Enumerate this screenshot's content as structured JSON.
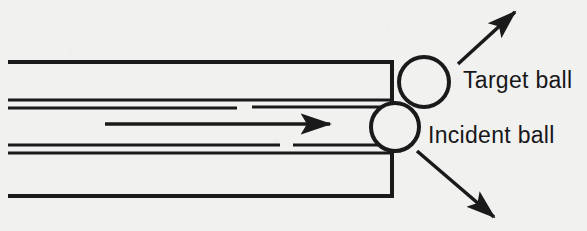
{
  "figure": {
    "background_color": "#f1f1f0",
    "ink_color": "#1a1a1a",
    "width": 587,
    "height": 231
  },
  "labels": {
    "target_ball": "Target ball",
    "incident_ball": "Incident ball"
  },
  "balls": [
    {
      "name": "target-ball",
      "label": "Target ball",
      "cx": 424,
      "cy": 82,
      "r": 25,
      "stroke_width": 4
    },
    {
      "name": "incident-ball",
      "label": "Incident ball",
      "cx": 395,
      "cy": 127,
      "r": 24,
      "stroke_width": 4
    }
  ],
  "rails": {
    "top_rail": {
      "x1": 8,
      "y1": 62,
      "x2": 392,
      "y2": 62,
      "stroke_width": 4
    },
    "top_rail_edge": {
      "x1": 392,
      "y1": 60,
      "x2": 392,
      "y2": 104,
      "stroke_width": 4
    },
    "bottom_rail": {
      "x1": 8,
      "y1": 196,
      "x2": 392,
      "y2": 196,
      "stroke_width": 4
    },
    "bottom_rail_edge": {
      "x1": 392,
      "y1": 150,
      "x2": 392,
      "y2": 198,
      "stroke_width": 4
    }
  },
  "channel_lines": [
    {
      "name": "upper-channel-line-a",
      "x1": 8,
      "y1": 100,
      "x2": 392,
      "y2": 100,
      "stroke_width": 3
    },
    {
      "name": "upper-channel-line-b",
      "x1": 8,
      "y1": 108,
      "x2": 237,
      "y2": 108,
      "stroke_width": 3
    },
    {
      "name": "upper-channel-line-b-cont",
      "x1": 252,
      "y1": 107,
      "x2": 392,
      "y2": 107,
      "stroke_width": 3
    },
    {
      "name": "lower-channel-line-a",
      "x1": 8,
      "y1": 145,
      "x2": 280,
      "y2": 145,
      "stroke_width": 3
    },
    {
      "name": "lower-channel-line-a-cont",
      "x1": 293,
      "y1": 145,
      "x2": 380,
      "y2": 145,
      "stroke_width": 3
    },
    {
      "name": "lower-channel-line-b",
      "x1": 8,
      "y1": 153,
      "x2": 392,
      "y2": 153,
      "stroke_width": 3
    }
  ],
  "arrows": [
    {
      "name": "incident-velocity-arrow",
      "direction": "right",
      "x1": 105,
      "y1": 124,
      "x2": 337,
      "y2": 124,
      "stroke_width": 3.5
    },
    {
      "name": "target-ball-velocity-arrow",
      "direction": "upper-right",
      "x1": 458,
      "y1": 64,
      "x2": 520,
      "y2": 7,
      "stroke_width": 3.5
    },
    {
      "name": "incident-ball-deflection-arrow",
      "direction": "lower-right",
      "x1": 417,
      "y1": 151,
      "x2": 500,
      "y2": 223,
      "stroke_width": 3.5
    }
  ]
}
